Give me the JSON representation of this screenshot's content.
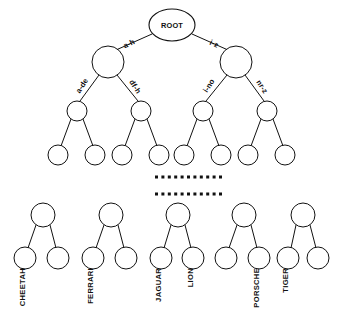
{
  "diagram": {
    "type": "trie-tree",
    "root": {
      "label": "ROOT",
      "cx": 172,
      "cy": 25,
      "rx": 23,
      "ry": 16
    },
    "edge_labels": {
      "level1_left": "a-h",
      "level1_right": "i-z",
      "level2_a": "a-de",
      "level2_b": "df-h",
      "level2_c": "i-no",
      "level2_d": "nr-z"
    },
    "level1_nodes": [
      {
        "id": "n-left",
        "cx": 108,
        "cy": 62,
        "r": 16
      },
      {
        "id": "n-right",
        "cx": 236,
        "cy": 62,
        "r": 16
      }
    ],
    "level2_nodes": [
      {
        "id": "n-a-de",
        "cx": 77,
        "cy": 111,
        "r": 10
      },
      {
        "id": "n-df-h",
        "cx": 141,
        "cy": 111,
        "r": 10
      },
      {
        "id": "n-i-no",
        "cx": 203,
        "cy": 111,
        "r": 10
      },
      {
        "id": "n-nr-z",
        "cx": 267,
        "cy": 111,
        "r": 10
      }
    ],
    "level3_nodes": [
      {
        "id": "l1",
        "cx": 58,
        "cy": 155,
        "r": 10
      },
      {
        "id": "l2",
        "cx": 95,
        "cy": 155,
        "r": 10
      },
      {
        "id": "l3",
        "cx": 122,
        "cy": 155,
        "r": 10
      },
      {
        "id": "l4",
        "cx": 159,
        "cy": 155,
        "r": 10
      },
      {
        "id": "l5",
        "cx": 184,
        "cy": 155,
        "r": 10
      },
      {
        "id": "l6",
        "cx": 221,
        "cy": 155,
        "r": 10
      },
      {
        "id": "l7",
        "cx": 248,
        "cy": 155,
        "r": 10
      },
      {
        "id": "l8",
        "cx": 285,
        "cy": 155,
        "r": 10
      }
    ],
    "ellipsis_rows": [
      {
        "id": "ellipsis-upper",
        "y": 177,
        "x_start": 155,
        "count": 11,
        "gap": 6.4,
        "size": 3.0
      },
      {
        "id": "ellipsis-lower",
        "y": 194,
        "x_start": 155,
        "count": 11,
        "gap": 6.4,
        "size": 3.0
      }
    ],
    "subtrees": [
      {
        "id": "subtree-cheetah",
        "parent": {
          "cx": 43,
          "cy": 215,
          "r": 12
        },
        "left": {
          "cx": 25,
          "cy": 258,
          "r": 11,
          "label": "CHEETAH"
        },
        "right": {
          "cx": 58,
          "cy": 258,
          "r": 11,
          "label": ""
        }
      },
      {
        "id": "subtree-ferrari",
        "parent": {
          "cx": 111,
          "cy": 215,
          "r": 12
        },
        "left": {
          "cx": 93,
          "cy": 258,
          "r": 11,
          "label": "FERRARI"
        },
        "right": {
          "cx": 126,
          "cy": 258,
          "r": 11,
          "label": ""
        }
      },
      {
        "id": "subtree-jaguar-lion",
        "parent": {
          "cx": 178,
          "cy": 215,
          "r": 12
        },
        "left": {
          "cx": 161,
          "cy": 258,
          "r": 11,
          "label": "JAGUAR"
        },
        "right": {
          "cx": 193,
          "cy": 258,
          "r": 11,
          "label": "LION"
        }
      },
      {
        "id": "subtree-porsche",
        "parent": {
          "cx": 244,
          "cy": 215,
          "r": 12
        },
        "left": {
          "cx": 226,
          "cy": 258,
          "r": 11,
          "label": ""
        },
        "right": {
          "cx": 259,
          "cy": 258,
          "r": 11,
          "label": "PORSCHE"
        }
      },
      {
        "id": "subtree-tiger",
        "parent": {
          "cx": 303,
          "cy": 215,
          "r": 12
        },
        "left": {
          "cx": 288,
          "cy": 258,
          "r": 11,
          "label": "TIGER"
        },
        "right": {
          "cx": 318,
          "cy": 258,
          "r": 11,
          "label": ""
        }
      }
    ]
  }
}
